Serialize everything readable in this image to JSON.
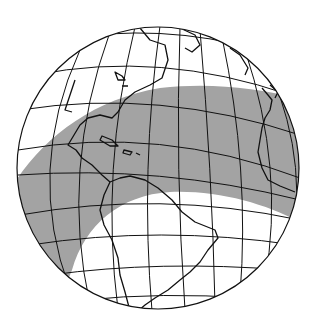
{
  "map": {
    "type": "orthographic-globe",
    "region_shown": "Americas and Atlantic Ocean",
    "colors": {
      "background": "#ffffff",
      "ocean": "#ffffff",
      "shaded_band": "#a3a3a3",
      "lines": "#111111"
    },
    "features": {
      "graticule": true,
      "coastlines": true,
      "shaded_band": "curved gray band crossing Atlantic from Central America / northern South America to West Africa"
    }
  }
}
